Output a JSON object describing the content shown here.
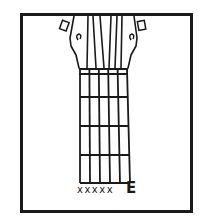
{
  "diagram": {
    "type": "guitar-chord-chart",
    "chord_name": "E",
    "string_markers": "xxxxx",
    "strings": 6,
    "frets_shown": 4,
    "colors": {
      "ink": "#1a1a1a",
      "background": "#ffffff"
    }
  }
}
